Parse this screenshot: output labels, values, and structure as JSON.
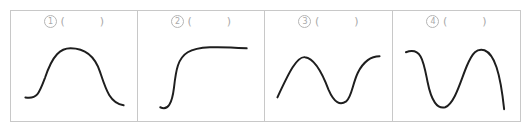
{
  "panels": [
    {
      "number": "1",
      "open_paren": "(",
      "close_paren": ")",
      "shape": "bell-curve"
    },
    {
      "number": "2",
      "open_paren": "(",
      "close_paren": ")",
      "shape": "sigmoid-rise-plateau"
    },
    {
      "number": "3",
      "open_paren": "(",
      "close_paren": ")",
      "shape": "rise-fall-rise"
    },
    {
      "number": "4",
      "open_paren": "(",
      "close_paren": ")",
      "shape": "fall-rise-fall"
    }
  ],
  "colors": {
    "border": "#c8c8c8",
    "label": "#a9a9a9",
    "curve": "#1e1e1e"
  }
}
